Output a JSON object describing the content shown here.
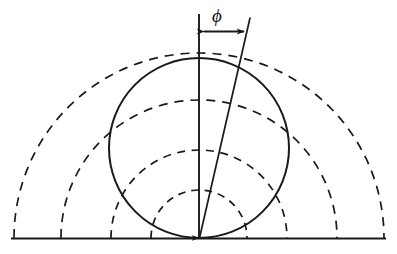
{
  "figure": {
    "kind": "geometric-diagram",
    "background_color": "#ffffff",
    "stroke_color": "#1a1a1a"
  },
  "labels": {
    "angle_symbol": "ϕ"
  },
  "geometry": {
    "vertex": {
      "x": 199,
      "y": 238
    },
    "baseline": {
      "name": "ground-line",
      "x1": 12,
      "y1": 238,
      "x2": 385,
      "y2": 238,
      "style": "solid"
    },
    "solid_circle": {
      "name": "tangent-circle",
      "cx": 199,
      "cy": 148,
      "r": 90,
      "style": "solid"
    },
    "dashed_arcs": [
      {
        "name": "arc-1",
        "radius": 48,
        "style": "dashed"
      },
      {
        "name": "arc-2",
        "radius": 88,
        "style": "dashed"
      },
      {
        "name": "arc-3",
        "radius": 138,
        "style": "dashed"
      },
      {
        "name": "arc-4",
        "radius": 185,
        "style": "dashed"
      }
    ],
    "vertical_line": {
      "name": "reference-axis",
      "x1": 199,
      "y1": 238,
      "x2": 199,
      "y2": 12,
      "style": "solid",
      "arrowhead": "down-at-top"
    },
    "slanted_line": {
      "name": "tilt-ray",
      "x1": 199,
      "y1": 238,
      "x2": 250,
      "y2": 18,
      "style": "solid",
      "angle_degrees": 13
    },
    "angle_arrow": {
      "name": "phi-span-arrow",
      "x1": 203,
      "y1": 31,
      "x2": 245,
      "y2": 31,
      "style": "double-headed-horizontal"
    },
    "phi_label_position": {
      "x": 214,
      "y": 8
    }
  }
}
